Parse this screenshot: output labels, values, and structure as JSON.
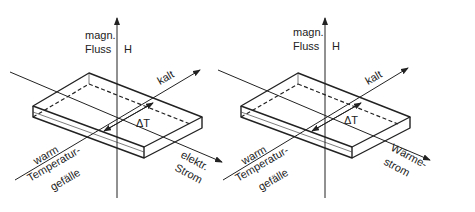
{
  "figures": [
    {
      "id": "left",
      "axis_label_line1": "magn.",
      "axis_label_line2": "Fluss",
      "axis_symbol": "H",
      "cold_label": "kalt",
      "delta_label": "ΔT",
      "warm_label": "warm",
      "gradient_line1": "Temperatur-",
      "gradient_line2": "gefälle",
      "flow_line1": "elektr.",
      "flow_line2": "Strom"
    },
    {
      "id": "right",
      "axis_label_line1": "magn.",
      "axis_label_line2": "Fluss",
      "axis_symbol": "H",
      "cold_label": "kalt",
      "delta_label": "ΔT",
      "warm_label": "warm",
      "gradient_line1": "Temperatur-",
      "gradient_line2": "gefälle",
      "flow_line1": "Wärme-",
      "flow_line2": "strom"
    }
  ],
  "colors": {
    "line": "#222222",
    "background": "#ffffff"
  }
}
